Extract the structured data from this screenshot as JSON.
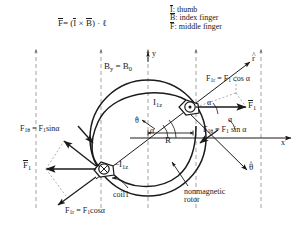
{
  "figure": {
    "colors": {
      "ink": "#1a1a1a",
      "dashed": "#8c8c8c",
      "background": "#ffffff"
    }
  },
  "formula": {
    "F": "F",
    "equals": "= (",
    "I": "I",
    "cross": "×",
    "B": "B",
    "tail": ") · ℓ"
  },
  "legend": {
    "items": [
      {
        "symbol": "I",
        "colon": ":",
        "text": "thumb"
      },
      {
        "symbol": "B",
        "colon": ":",
        "text": "index finger"
      },
      {
        "symbol": "F",
        "colon": ":",
        "text": "middle finger"
      }
    ]
  },
  "axes": {
    "y_label": "y",
    "x_label": "x",
    "field_label_B": "B",
    "field_label_sub_y": "y",
    "field_equals": "= B",
    "field_sub_0": "0",
    "radius_label": "R"
  },
  "unit_vectors": {
    "r": "r",
    "theta_right": "θ",
    "theta_center": "θ"
  },
  "angles": {
    "alpha_top_right": "α",
    "alpha_mid_right": "α",
    "alpha_center": "α",
    "alpha_far_right": "α"
  },
  "currents": {
    "top_coil": {
      "prefix": "",
      "symbol": "I",
      "sub": "1z"
    },
    "bottom_coil": {
      "prefix": "−",
      "symbol": "I",
      "sub": "1z"
    }
  },
  "forces": {
    "top_right_radial": {
      "lhs": "F",
      "lhs_sub": "1r",
      "rhs": "= F",
      "rhs_sub": "1",
      "tail": " cos α"
    },
    "right_tangential": {
      "lhs": "F",
      "lhs_sub": "1θ",
      "rhs": "= F",
      "rhs_sub": "1",
      "tail": " sin α"
    },
    "left_tangential": {
      "lhs": "F",
      "lhs_sub": "1θ",
      "rhs": "= F",
      "rhs_sub": "1",
      "tail": "sinα"
    },
    "bottom_left_radial": {
      "lhs": "F",
      "lhs_sub": "1r",
      "rhs": "= F",
      "rhs_sub": "1",
      "tail": "cosα"
    },
    "vector_right": {
      "symbol": "F",
      "sub": "1"
    },
    "vector_left": {
      "symbol": "F",
      "sub": "1"
    }
  },
  "annotations": {
    "coil": "coil1",
    "rotor_line1": "nonmagnetic",
    "rotor_line2": "rotor"
  }
}
